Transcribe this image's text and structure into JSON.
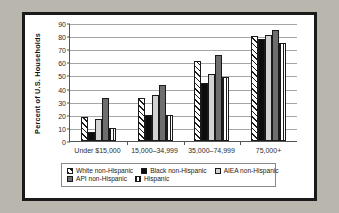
{
  "chart_data": {
    "type": "bar",
    "title": "",
    "xlabel": "",
    "ylabel": "Percent of U.S. Households",
    "ylim": [
      0,
      90
    ],
    "ytick_step": 10,
    "yticks": [
      90,
      80,
      70,
      60,
      50,
      40,
      30,
      20,
      10,
      0
    ],
    "grid": true,
    "legend_position": "bottom",
    "categories": [
      "Under $15,000",
      "15,000–34,999",
      "35,000–74,999",
      "75,000+"
    ],
    "series": [
      {
        "name": "White non-Hispanic",
        "key": "s-white",
        "values": [
          18,
          33,
          61,
          80
        ]
      },
      {
        "name": "Black non-Hispanic",
        "key": "s-black",
        "values": [
          7,
          20,
          44,
          78
        ]
      },
      {
        "name": "AIEA non-Hispanic",
        "key": "s-aiea",
        "values": [
          17,
          35,
          51,
          80.5
        ]
      },
      {
        "name": "API non-Hispanic",
        "key": "s-api",
        "values": [
          33,
          43,
          65.5,
          85
        ]
      },
      {
        "name": "Hispanic",
        "key": "s-hisp",
        "values": [
          10,
          20,
          49,
          75
        ]
      }
    ]
  },
  "legend": {
    "row1": [
      {
        "label": "White non-Hispanic",
        "key": "s-white"
      },
      {
        "label": "Black non-Hispanic",
        "key": "s-black"
      },
      {
        "label": "AIEA non-Hispanic",
        "key": "s-aiea"
      }
    ],
    "row2": [
      {
        "label": "API non-Hispanic",
        "key": "s-api"
      },
      {
        "label": "Hispanic",
        "key": "s-hisp"
      }
    ]
  },
  "colors": {
    "white_series": "#ffffff",
    "black_series": "#0d0d0d",
    "aiea_series": "#d2d2d2",
    "api_series": "#6e6e6e",
    "hispanic_series": "#ffffff",
    "background": "#b9b6ae",
    "frame": "#1a1a1a",
    "gridline": "#a6a6a6"
  }
}
